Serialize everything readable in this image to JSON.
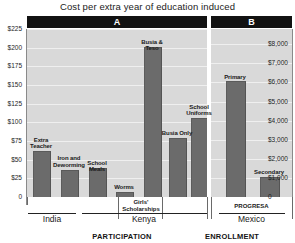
{
  "chart_data": {
    "type": "bar",
    "title": "Cost per extra year of education induced",
    "xlabel": "",
    "ylabel": "",
    "grid": true,
    "legend": "none",
    "panels": [
      {
        "key": "A",
        "label": "A",
        "section_label": "PARTICIPATION",
        "ylim": [
          0,
          225
        ],
        "yticks": [
          "$225",
          "$200",
          "$175",
          "$150",
          "$125",
          "$100",
          "$75",
          "$50",
          "$25",
          "0"
        ],
        "ytick_values": [
          225,
          200,
          175,
          150,
          125,
          100,
          75,
          50,
          25,
          0
        ],
        "axis_side": "left",
        "categories": [
          "Extra Teacher",
          "Iron and Deworming",
          "School Meals",
          "Worms",
          "Busia & Teso",
          "Busia Only",
          "School Uniforms"
        ],
        "values": [
          60,
          35,
          38,
          5,
          200,
          78,
          104
        ],
        "groups": [
          {
            "label": "India",
            "categories": [
              "Extra Teacher",
              "Iron and Deworming",
              "School Meals"
            ]
          },
          {
            "label": "Kenya",
            "sublabel": "Girls' Scholarships",
            "categories": [
              "Worms",
              "Busia & Teso",
              "Busia Only",
              "School Uniforms"
            ]
          }
        ]
      },
      {
        "key": "B",
        "label": "B",
        "section_label": "ENROLLMENT",
        "ylim": [
          0,
          8800
        ],
        "yticks": [
          "$8,000",
          "$7,000",
          "$6,000",
          "$5,000",
          "$4,000",
          "$3,000",
          "$2,000",
          "$1,000",
          "0"
        ],
        "ytick_values": [
          8000,
          7000,
          6000,
          5000,
          4000,
          3000,
          2000,
          1000,
          0
        ],
        "axis_side": "right",
        "categories": [
          "Primary",
          "Secondary"
        ],
        "values": [
          6000,
          1000
        ],
        "groups": [
          {
            "label": "Mexico",
            "sublabel": "PROGRESA",
            "categories": [
              "Primary",
              "Secondary"
            ]
          }
        ]
      }
    ]
  },
  "colors": {
    "bar": "#6b6b6b",
    "plot_background": "#d9d9d9",
    "header_background": "#121212",
    "header_text": "#ffffff",
    "gridline": "#efefef",
    "text": "#1a1a1a"
  }
}
